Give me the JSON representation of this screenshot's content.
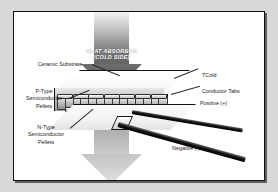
{
  "figure": {
    "background_color": "#d8d8d6",
    "plate_color": "#ffffff",
    "border_color": "#101010"
  },
  "arrows": [
    {
      "name": "heat-absorbed-arrow",
      "line1": "HEAT ABSORBED",
      "line2": "(COLD SIDE)",
      "direction": "down",
      "position": "top",
      "color": "#5c5c5c",
      "text_color": "#ffffff"
    },
    {
      "name": "heat-rejected-arrow",
      "line1": "HEAT REJECTED",
      "line2": "(HOT SIDE)",
      "direction": "down",
      "position": "bottom",
      "color": "#bdbdbd",
      "text_color": "#e9e9e9"
    }
  ],
  "labels": {
    "ceramic_substrate": "Ceramic Substrate",
    "p_type": "P-Type\nSemiconductor\nPellets",
    "n_type": "N-Type\nSemiconductor\nPellets",
    "tcold": "TCold",
    "conductor_tabs": "Conductor Tabs",
    "positive": "Positive (+)",
    "negative": "Negative (-)"
  },
  "module": {
    "pellet_count": 14,
    "tab_count": 7,
    "top_plate": "ceramic substrate (cold side)",
    "bottom_plate": "ceramic substrate (hot side)"
  },
  "leads": [
    {
      "name": "positive-lead",
      "polarity": "Positive (+)",
      "color": "#000000"
    },
    {
      "name": "negative-lead",
      "polarity": "Negative (-)",
      "color": "#000000"
    }
  ]
}
